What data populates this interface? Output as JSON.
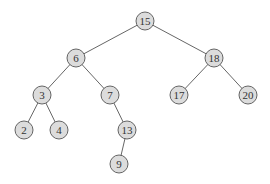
{
  "diagram": {
    "type": "binary-search-tree",
    "nodes": [
      {
        "id": "n15",
        "label": "15",
        "x": 145,
        "y": 21
      },
      {
        "id": "n6",
        "label": "6",
        "x": 76,
        "y": 58
      },
      {
        "id": "n18",
        "label": "18",
        "x": 214,
        "y": 58
      },
      {
        "id": "n3",
        "label": "3",
        "x": 42,
        "y": 95
      },
      {
        "id": "n7",
        "label": "7",
        "x": 110,
        "y": 95
      },
      {
        "id": "n17",
        "label": "17",
        "x": 179,
        "y": 95
      },
      {
        "id": "n20",
        "label": "20",
        "x": 248,
        "y": 95
      },
      {
        "id": "n2",
        "label": "2",
        "x": 24,
        "y": 130
      },
      {
        "id": "n4",
        "label": "4",
        "x": 59,
        "y": 130
      },
      {
        "id": "n13",
        "label": "13",
        "x": 127,
        "y": 130
      },
      {
        "id": "n9",
        "label": "9",
        "x": 119,
        "y": 164
      }
    ],
    "edges": [
      {
        "from": "n15",
        "to": "n6"
      },
      {
        "from": "n15",
        "to": "n18"
      },
      {
        "from": "n6",
        "to": "n3"
      },
      {
        "from": "n6",
        "to": "n7"
      },
      {
        "from": "n18",
        "to": "n17"
      },
      {
        "from": "n18",
        "to": "n20"
      },
      {
        "from": "n3",
        "to": "n2"
      },
      {
        "from": "n3",
        "to": "n4"
      },
      {
        "from": "n7",
        "to": "n13"
      },
      {
        "from": "n13",
        "to": "n9"
      }
    ],
    "node_radius": 9,
    "colors": {
      "node_fill": "#dcdcdc",
      "node_stroke": "#555555",
      "edge": "#555555",
      "label": "#333333"
    }
  }
}
